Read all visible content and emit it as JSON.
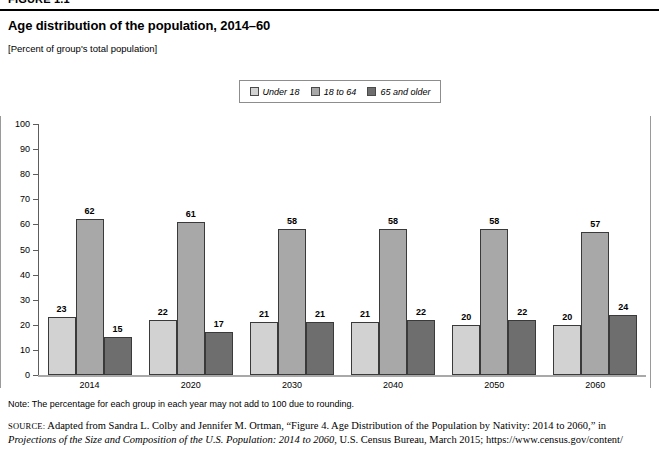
{
  "figure": {
    "tag": "FIGURE 1.1"
  },
  "title": "Age distribution of the population, 2014–60",
  "subtitle": "[Percent of group's total population]",
  "legend": {
    "items": [
      {
        "label": "Under 18",
        "color": "#d2d2d2"
      },
      {
        "label": "18 to 64",
        "color": "#a8a8a8"
      },
      {
        "label": "65 and older",
        "color": "#6e6e6e"
      }
    ]
  },
  "axis": {
    "y_ticks": [
      "100",
      "90",
      "80",
      "70",
      "60",
      "50",
      "40",
      "30",
      "20",
      "10",
      "0"
    ]
  },
  "note": "Note: The percentage for each group in each year may not add to 100 due to rounding.",
  "source": {
    "word": "SOURCE:",
    "part1": " Adapted from Sandra L. Colby and Jennifer M. Ortman, “Figure 4. Age Distribution of the Population by Nativity: 2014 to 2060,” in ",
    "italic": "Projections of the Size and Composition of the U.S. Population: 2014 to 2060",
    "part2": ", U.S. Census Bureau, March 2015; https://www.census.gov/content/"
  },
  "chart_data": {
    "type": "bar",
    "title": "Age distribution of the population, 2014–60",
    "subtitle": "[Percent of group's total population]",
    "xlabel": "",
    "ylabel": "",
    "ylim": [
      0,
      100
    ],
    "ytick_step": 10,
    "grid": false,
    "legend_position": "top-center",
    "categories": [
      "2014",
      "2020",
      "2030",
      "2040",
      "2050",
      "2060"
    ],
    "series": [
      {
        "name": "Under 18",
        "color": "#d2d2d2",
        "values": [
          23,
          22,
          21,
          21,
          20,
          20
        ]
      },
      {
        "name": "18 to 64",
        "color": "#a8a8a8",
        "values": [
          62,
          61,
          58,
          58,
          58,
          57
        ]
      },
      {
        "name": "65 and older",
        "color": "#6e6e6e",
        "values": [
          15,
          17,
          21,
          22,
          22,
          24
        ]
      }
    ]
  }
}
